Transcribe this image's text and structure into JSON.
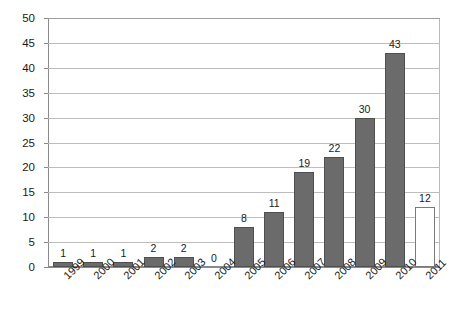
{
  "chart_data": {
    "type": "bar",
    "title": "",
    "subtitle": "",
    "xlabel": "",
    "ylabel": "",
    "categories": [
      "1999",
      "2000",
      "2001",
      "2002",
      "2003",
      "2004",
      "2005",
      "2006",
      "2007",
      "2008",
      "2009",
      "2010",
      "2011"
    ],
    "values": [
      1,
      1,
      1,
      2,
      2,
      0,
      8,
      11,
      19,
      22,
      30,
      43,
      12
    ],
    "value_labels": [
      "1",
      "1",
      "1",
      "2",
      "2",
      "0",
      "8",
      "11",
      "19",
      "22",
      "30",
      "43",
      "12"
    ],
    "bar_styles": [
      "filled",
      "filled",
      "filled",
      "filled",
      "filled",
      "none",
      "filled",
      "filled",
      "filled",
      "filled",
      "filled",
      "filled",
      "hollow"
    ],
    "ylim": [
      0,
      50
    ],
    "ytick_step": 5,
    "ytick_labels": [
      "0",
      "5",
      "10",
      "15",
      "20",
      "25",
      "30",
      "35",
      "40",
      "45",
      "50"
    ],
    "grid": true,
    "grid_axis": "y",
    "legend": "none",
    "x_label_rotation_deg": -45,
    "colors": {
      "bar_fill": "#6b6b6b",
      "bar_border": "#4f4f4f",
      "hollow_fill": "#ffffff",
      "hollow_border": "#7a7a7a",
      "gridline": "#bdbdbd",
      "axis": "#8a8a8a",
      "background": "#ffffff",
      "text": "#1a1a1a"
    }
  }
}
